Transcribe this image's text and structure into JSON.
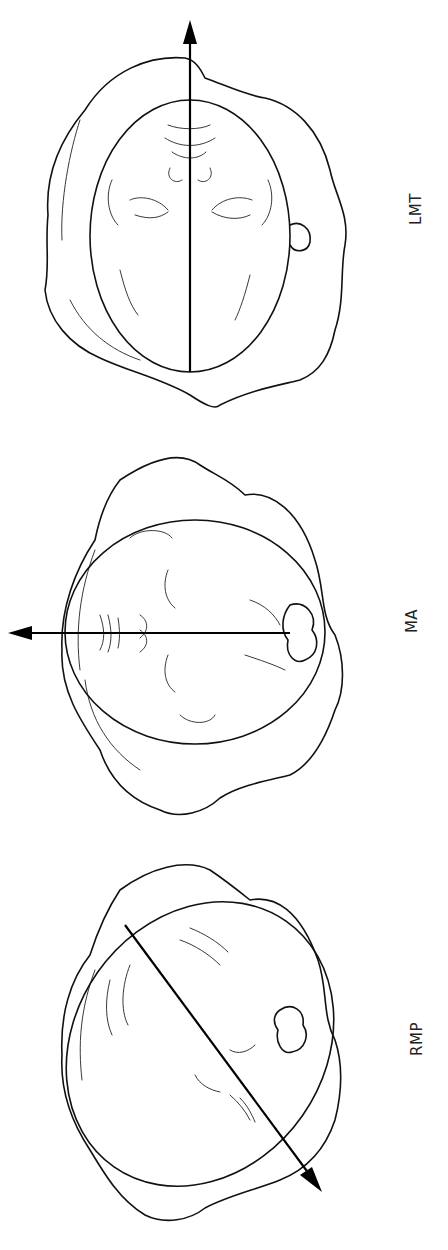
{
  "figure": {
    "orientation": "rotated-90",
    "panels": [
      {
        "id": "lmt",
        "label": "LMT",
        "description": "Fetal head in left mentum transverse position; arrow along long axis pointing up"
      },
      {
        "id": "ma",
        "label": "MA",
        "description": "Fetal head in mentum anterior position; arrow pointing left"
      },
      {
        "id": "rmp",
        "label": "RMP",
        "description": "Fetal head in right mentum posterior position; diagonal arrow pointing down-right"
      }
    ]
  },
  "colors": {
    "line": "#111111",
    "background": "#ffffff"
  }
}
